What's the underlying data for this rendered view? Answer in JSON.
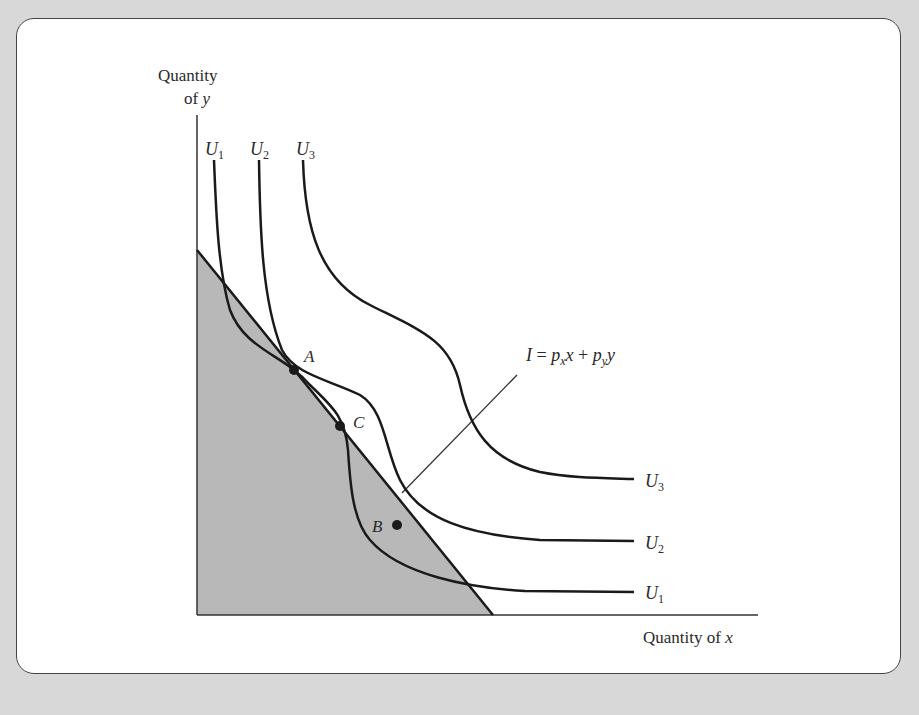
{
  "diagram": {
    "y_axis_label_line1": "Quantity",
    "y_axis_label_line2_prefix": "of ",
    "y_axis_label_line2_var": "y",
    "x_axis_label_prefix": "Quantity of ",
    "x_axis_label_var": "x",
    "budget_line_label": {
      "lhs": "I",
      "eq": " = ",
      "p1": "p",
      "p1_sub": "x",
      "v1": "x",
      "plus": " + ",
      "p2": "p",
      "p2_sub": "y",
      "v2": "y"
    },
    "curves": [
      {
        "name": "U",
        "sub": "1"
      },
      {
        "name": "U",
        "sub": "2"
      },
      {
        "name": "U",
        "sub": "3"
      }
    ],
    "points": {
      "A": "A",
      "B": "B",
      "C": "C"
    },
    "colors": {
      "background": "#d8d8d8",
      "panel": "#ffffff",
      "shaded_region": "#b8b8b8",
      "lines": "#1a1a1a"
    }
  }
}
